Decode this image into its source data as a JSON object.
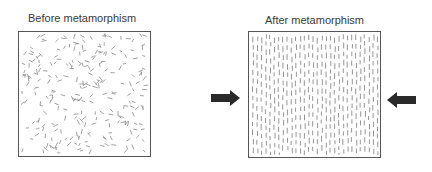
{
  "diagram": {
    "title_before": "Before metamorphism",
    "title_after": "After metamorphism",
    "panels": [
      {
        "id": "before",
        "label": "Before metamorphism",
        "texture": "randomly oriented mineral grains"
      },
      {
        "id": "after",
        "label": "After metamorphism",
        "texture": "aligned (foliated) mineral grains, vertical"
      }
    ],
    "arrows": [
      {
        "id": "left-arrow",
        "direction": "right",
        "meaning": "compressional stress"
      },
      {
        "id": "right-arrow",
        "direction": "left",
        "meaning": "compressional stress"
      }
    ],
    "colors": {
      "border": "#555555",
      "grain": "#8a8a8a",
      "arrow": "#2a2a2a",
      "text": "#3a3a3a"
    }
  }
}
